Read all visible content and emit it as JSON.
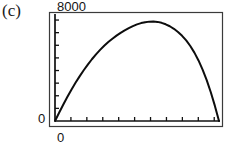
{
  "panel": {
    "letter": "(c)"
  },
  "axes": {
    "y_max_label": "8000",
    "y_min_label": "0",
    "x_min_label": "0",
    "y_tick_count": 8,
    "x_tick_count": 10,
    "frame": {
      "left": 49,
      "top": 12,
      "right": 222,
      "bottom": 126
    },
    "plot": {
      "left": 55,
      "top": 15,
      "right": 219,
      "bottom": 121
    }
  },
  "chart_data": {
    "type": "line",
    "title": "(c)",
    "xlabel": "",
    "ylabel": "",
    "xlim": [
      0,
      10
    ],
    "ylim": [
      0,
      8000
    ],
    "grid": false,
    "legend": null,
    "tick_labels": {
      "y": [
        "0",
        "8000"
      ],
      "x": [
        "0"
      ]
    },
    "annotations": [
      "(c)"
    ],
    "series": [
      {
        "name": "curve",
        "x": [
          0.0,
          0.25,
          0.5,
          0.75,
          1.0,
          1.25,
          1.5,
          1.75,
          2.0,
          2.25,
          2.5,
          2.75,
          3.0,
          3.25,
          3.5,
          3.75,
          4.0,
          4.25,
          4.5,
          4.75,
          5.0,
          5.25,
          5.5,
          5.75,
          6.0,
          6.25,
          6.5,
          6.75,
          7.0,
          7.25,
          7.5,
          7.75,
          8.0,
          8.25,
          8.5,
          8.75,
          9.0,
          9.25,
          9.5,
          9.75,
          10.0
        ],
        "y": [
          0,
          620,
          1230,
          1810,
          2360,
          2880,
          3370,
          3830,
          4260,
          4660,
          5030,
          5370,
          5680,
          5960,
          6210,
          6440,
          6650,
          6840,
          7010,
          7160,
          7290,
          7390,
          7460,
          7500,
          7510,
          7480,
          7410,
          7300,
          7150,
          6960,
          6720,
          6430,
          6080,
          5660,
          5160,
          4570,
          3880,
          3080,
          2170,
          1140,
          0
        ]
      }
    ]
  }
}
